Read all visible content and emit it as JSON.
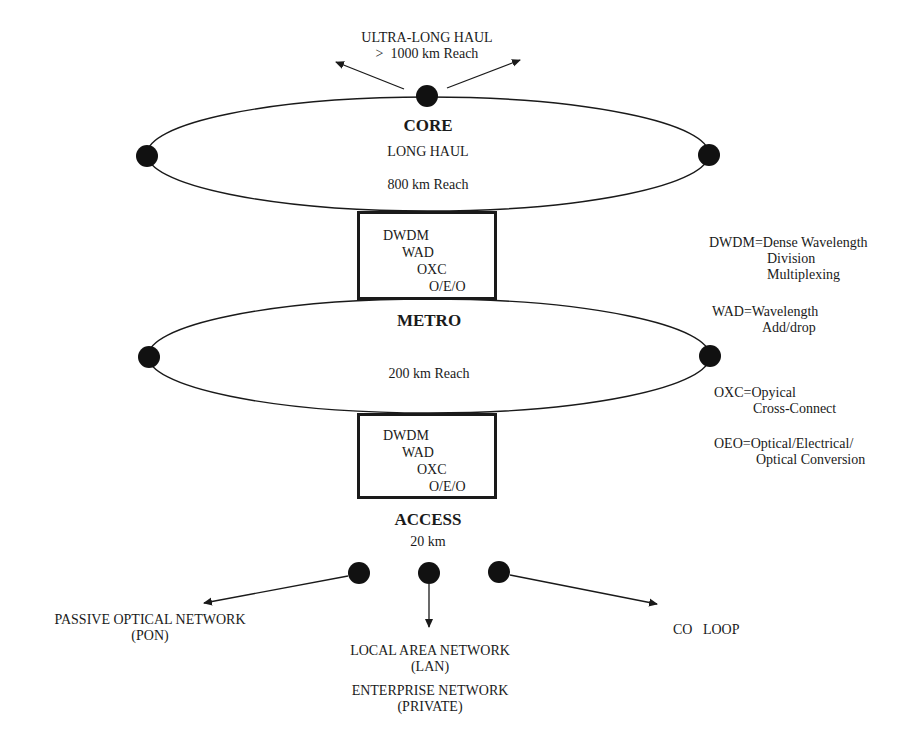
{
  "diagram": {
    "ultra_long_haul": {
      "line1": "ULTRA-LONG HAUL",
      "line2": ">  1000 km Reach"
    },
    "core": {
      "title": "CORE",
      "subtitle": "LONG HAUL",
      "reach": "800 km Reach"
    },
    "core_metro_box": {
      "items": [
        "DWDM",
        "WAD",
        "OXC",
        "O/E/O"
      ]
    },
    "metro": {
      "title": "METRO",
      "reach": "200 km Reach"
    },
    "metro_access_box": {
      "items": [
        "DWDM",
        "WAD",
        "OXC",
        "O/E/O"
      ]
    },
    "access": {
      "title": "ACCESS",
      "reach": "20 km"
    },
    "access_targets": {
      "pon": {
        "line1": "PASSIVE OPTICAL NETWORK",
        "line2": "(PON)"
      },
      "lan": {
        "line1": "LOCAL AREA NETWORK",
        "line2": "(LAN)",
        "line3": "ENTERPRISE NETWORK",
        "line4": "(PRIVATE)"
      },
      "co_loop": {
        "line1": "CO   LOOP"
      }
    },
    "legend": {
      "dwdm": {
        "line1": "DWDM=Dense Wavelength",
        "line2": "Division",
        "line3": "Multiplexing"
      },
      "wad": {
        "line1": "WAD=Wavelength",
        "line2": "Add/drop"
      },
      "oxc": {
        "line1": "OXC=Opyical",
        "line2": "Cross-Connect"
      },
      "oeo": {
        "line1": "OEO=Optical/Electrical/",
        "line2": "Optical Conversion"
      }
    },
    "colors": {
      "ink": "#1a1a1a",
      "background": "#ffffff"
    }
  }
}
